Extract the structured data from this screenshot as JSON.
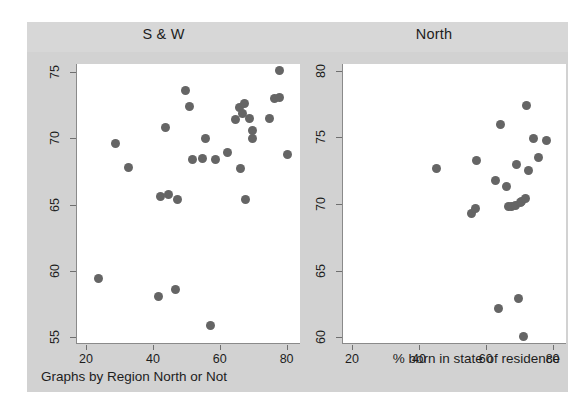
{
  "figure": {
    "xlabel": "% born in state of residence",
    "ylabel": "% who own home",
    "note": "Graphs by Region North or Not",
    "marker_color": "#656565",
    "panel_background": "#ffffff",
    "figure_background": "#d2d2d2"
  },
  "chart_data": {
    "type": "scatter",
    "title": "",
    "subtitle": "",
    "xlabel": "% born in state of residence",
    "ylabel": "% who own home",
    "note": "Graphs by Region North or Not",
    "grid": false,
    "legend": "none",
    "layout": "two panels side by side, shared x-axis label",
    "panels": [
      {
        "name": "S & W",
        "label": "S & W",
        "xlim": [
          17,
          84
        ],
        "ylim": [
          54.5,
          75.6
        ],
        "xticks": [
          20,
          40,
          60,
          80
        ],
        "yticks": [
          55,
          60,
          65,
          70,
          75
        ],
        "series": [
          {
            "name": "states",
            "marker": "filled-circle",
            "color": "#656565",
            "points": [
              {
                "x": 23.5,
                "y": 59.4
              },
              {
                "x": 28.5,
                "y": 69.6
              },
              {
                "x": 32.5,
                "y": 67.8
              },
              {
                "x": 41.5,
                "y": 58.1
              },
              {
                "x": 42.0,
                "y": 65.6
              },
              {
                "x": 43.5,
                "y": 70.8
              },
              {
                "x": 44.5,
                "y": 65.8
              },
              {
                "x": 46.5,
                "y": 58.6
              },
              {
                "x": 47.0,
                "y": 65.4
              },
              {
                "x": 49.5,
                "y": 73.6
              },
              {
                "x": 50.5,
                "y": 72.4
              },
              {
                "x": 51.5,
                "y": 68.4
              },
              {
                "x": 54.5,
                "y": 68.5
              },
              {
                "x": 55.5,
                "y": 70.0
              },
              {
                "x": 57.0,
                "y": 55.9
              },
              {
                "x": 58.5,
                "y": 68.4
              },
              {
                "x": 62.0,
                "y": 68.9
              },
              {
                "x": 64.5,
                "y": 71.4
              },
              {
                "x": 65.5,
                "y": 72.3
              },
              {
                "x": 66.0,
                "y": 67.7
              },
              {
                "x": 66.5,
                "y": 71.9
              },
              {
                "x": 67.0,
                "y": 72.6
              },
              {
                "x": 67.5,
                "y": 65.4
              },
              {
                "x": 68.5,
                "y": 71.5
              },
              {
                "x": 69.5,
                "y": 70.6
              },
              {
                "x": 69.5,
                "y": 70.0
              },
              {
                "x": 74.5,
                "y": 71.5
              },
              {
                "x": 76.0,
                "y": 73.0
              },
              {
                "x": 77.5,
                "y": 73.1
              },
              {
                "x": 77.5,
                "y": 75.1
              },
              {
                "x": 80.0,
                "y": 68.8
              }
            ]
          }
        ]
      },
      {
        "name": "North",
        "label": "North",
        "xlim": [
          17,
          84
        ],
        "ylim": [
          59.5,
          80.5
        ],
        "xticks": [
          20,
          40,
          60,
          80
        ],
        "yticks": [
          60,
          65,
          70,
          75,
          80
        ],
        "series": [
          {
            "name": "states",
            "marker": "filled-circle",
            "color": "#656565",
            "points": [
              {
                "x": 45.0,
                "y": 72.7
              },
              {
                "x": 55.5,
                "y": 69.3
              },
              {
                "x": 56.5,
                "y": 69.7
              },
              {
                "x": 57.0,
                "y": 73.3
              },
              {
                "x": 62.5,
                "y": 71.8
              },
              {
                "x": 63.5,
                "y": 62.2
              },
              {
                "x": 64.0,
                "y": 76.0
              },
              {
                "x": 66.0,
                "y": 71.3
              },
              {
                "x": 66.5,
                "y": 69.8
              },
              {
                "x": 67.5,
                "y": 69.8
              },
              {
                "x": 68.5,
                "y": 69.9
              },
              {
                "x": 69.0,
                "y": 73.0
              },
              {
                "x": 69.5,
                "y": 62.9
              },
              {
                "x": 70.0,
                "y": 70.1
              },
              {
                "x": 70.5,
                "y": 70.2
              },
              {
                "x": 71.0,
                "y": 60.1
              },
              {
                "x": 71.5,
                "y": 70.4
              },
              {
                "x": 72.0,
                "y": 77.4
              },
              {
                "x": 72.5,
                "y": 72.5
              },
              {
                "x": 74.0,
                "y": 74.9
              },
              {
                "x": 75.5,
                "y": 73.5
              },
              {
                "x": 78.0,
                "y": 74.8
              }
            ]
          }
        ]
      }
    ]
  }
}
